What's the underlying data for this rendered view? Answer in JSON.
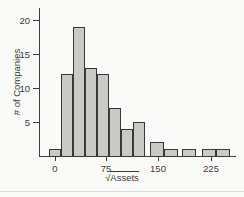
{
  "figure": {
    "background": "#fafaf8",
    "bar_fill": "#c9c9c6",
    "bar_border": "#383838",
    "axis_color": "#3d3d3d",
    "text_color": "#3a3a3a",
    "page_rule_color": "#d9d9d4"
  },
  "labels": {
    "y_axis": "# of Companies",
    "x_axis_radical": "√",
    "x_axis_radicand": "Assets"
  },
  "chart_data": {
    "type": "bar",
    "subtype": "histogram",
    "title": "",
    "xlabel": "√Assets",
    "ylabel": "# of Companies",
    "x_ticks": [
      0,
      75,
      150,
      225
    ],
    "y_ticks": [
      5,
      10,
      15,
      20
    ],
    "ylim": [
      0,
      21
    ],
    "xlim": [
      -20,
      260
    ],
    "grid": "off",
    "legend": "none",
    "counts": [
      1,
      12,
      19,
      13,
      12,
      7,
      4,
      5,
      2,
      1,
      1,
      1,
      1
    ],
    "bars": [
      {
        "count": 1,
        "x_px": 49,
        "w_px": 12,
        "x_range_units_approx": [
          -9,
          9
        ]
      },
      {
        "count": 12,
        "x_px": 61,
        "w_px": 12,
        "x_range_units_approx": [
          9,
          26
        ]
      },
      {
        "count": 19,
        "x_px": 73,
        "w_px": 12,
        "x_range_units_approx": [
          26,
          44
        ]
      },
      {
        "count": 13,
        "x_px": 85,
        "w_px": 12,
        "x_range_units_approx": [
          44,
          61
        ]
      },
      {
        "count": 12,
        "x_px": 97,
        "w_px": 12,
        "x_range_units_approx": [
          61,
          78
        ]
      },
      {
        "count": 7,
        "x_px": 109,
        "w_px": 12,
        "x_range_units_approx": [
          78,
          96
        ]
      },
      {
        "count": 4,
        "x_px": 121,
        "w_px": 12,
        "x_range_units_approx": [
          96,
          113
        ]
      },
      {
        "count": 5,
        "x_px": 133,
        "w_px": 12,
        "x_range_units_approx": [
          113,
          130
        ]
      },
      {
        "count": 2,
        "x_px": 150,
        "w_px": 14,
        "x_range_units_approx": [
          138,
          158
        ]
      },
      {
        "count": 1,
        "x_px": 164,
        "w_px": 14,
        "x_range_units_approx": [
          158,
          178
        ]
      },
      {
        "count": 1,
        "x_px": 182,
        "w_px": 14,
        "x_range_units_approx": [
          184,
          204
        ]
      },
      {
        "count": 1,
        "x_px": 202,
        "w_px": 14,
        "x_range_units_approx": [
          213,
          233
        ]
      },
      {
        "count": 1,
        "x_px": 216,
        "w_px": 14,
        "x_range_units_approx": [
          233,
          254
        ]
      }
    ],
    "layout_hints": {
      "axis_origin_px": {
        "x": 39,
        "y": 156
      },
      "x_axis_end_px": 236,
      "y_axis_top_px": 8,
      "unit_px": 6.8,
      "x_tick_px": [
        55,
        106,
        158,
        211
      ],
      "y_tick_px": [
        122,
        88,
        54,
        20
      ],
      "ylabel_center_px": {
        "x": 16,
        "y": 82
      },
      "xlabel_center_px": {
        "x": 122,
        "y": 172
      },
      "page_rule_y_px": 191
    }
  }
}
